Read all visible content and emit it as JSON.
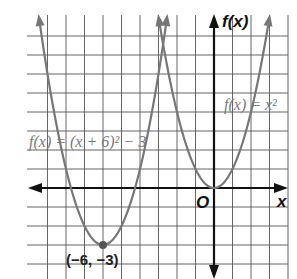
{
  "figure": {
    "type": "coordinate-graph",
    "axes": {
      "x_label": "x",
      "y_label": "f(x)",
      "origin_label": "O"
    },
    "grid": {
      "x_min_visible": -9,
      "x_max_visible": 4,
      "y_min_visible": -4,
      "y_max_visible": 9,
      "unit": 1
    },
    "curves": [
      {
        "name": "translated-parabola",
        "label": "f(x) = (x + 6)² − 3",
        "equation": "f(x) = (x + 6)^2 - 3",
        "vertex": [
          -6,
          -3
        ],
        "color": "#777777"
      },
      {
        "name": "parent-parabola",
        "label": "f(x) = x²",
        "equation": "f(x) = x^2",
        "vertex": [
          0,
          0
        ],
        "color": "#777777"
      }
    ],
    "points": [
      {
        "label": "(−6, −3)",
        "x": -6,
        "y": -3
      }
    ],
    "colors": {
      "grid": "#555555",
      "axes": "#111111",
      "curve": "#777777",
      "point": "#555555"
    }
  }
}
